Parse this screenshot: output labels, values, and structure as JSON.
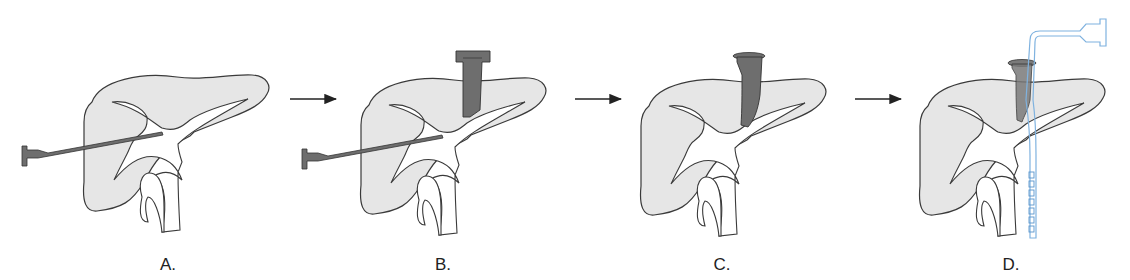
{
  "figure": {
    "panels": [
      {
        "id": "A",
        "label": "A.",
        "label_x": 168,
        "description": "Needle puncture into hepatic vein/biliary tree"
      },
      {
        "id": "B",
        "label": "B.",
        "label_x": 443,
        "description": "Needle in place, sheath inserted from top"
      },
      {
        "id": "C",
        "label": "C.",
        "label_x": 722,
        "description": "Sheath in place, needle removed"
      },
      {
        "id": "D",
        "label": "D.",
        "label_x": 1011,
        "description": "Catheter with side holes advanced through sheath"
      }
    ],
    "arrows": [
      {
        "from": "A",
        "to": "B"
      },
      {
        "from": "B",
        "to": "C"
      },
      {
        "from": "C",
        "to": "D"
      }
    ],
    "colors": {
      "liver_fill": "#e6e6e6",
      "outline": "#3a3a3a",
      "instrument": "#6e6e6e",
      "catheter": "#7fb2df"
    }
  }
}
